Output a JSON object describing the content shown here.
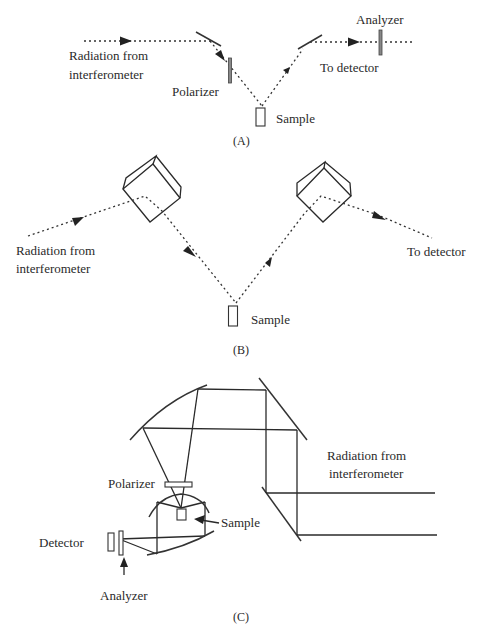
{
  "figure": {
    "panels": [
      {
        "id": "A",
        "caption": "(A)",
        "labels": {
          "source": [
            "Radiation from",
            "interferometer"
          ],
          "polarizer": "Polarizer",
          "sample": "Sample",
          "analyzer": "Analyzer",
          "detector": "To detector"
        }
      },
      {
        "id": "B",
        "caption": "(B)",
        "labels": {
          "source": [
            "Radiation from",
            "interferometer"
          ],
          "sample": "Sample",
          "detector": "To  detector"
        }
      },
      {
        "id": "C",
        "caption": "(C)",
        "labels": {
          "source": [
            "Radiation from",
            "interferometer"
          ],
          "polarizer": "Polarizer",
          "sample": "Sample",
          "detector": "Detector",
          "analyzer": "Analyzer"
        }
      }
    ]
  }
}
